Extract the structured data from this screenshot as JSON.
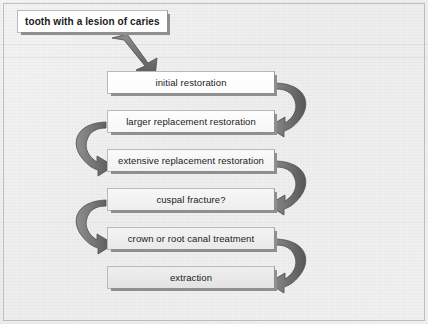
{
  "diagram": {
    "title_box": {
      "label": "tooth with a lesion of caries"
    },
    "steps": [
      {
        "id": "initial-restoration",
        "label": "initial restoration"
      },
      {
        "id": "larger-replacement-restoration",
        "label": "larger replacement restoration"
      },
      {
        "id": "extensive-replacement-restoration",
        "label": "extensive replacement restoration"
      },
      {
        "id": "cuspal-fracture",
        "label": "cuspal fracture?"
      },
      {
        "id": "crown-or-root-canal-treatment",
        "label": "crown or root canal treatment"
      },
      {
        "id": "extraction",
        "label": "extraction"
      }
    ],
    "connectors": [
      {
        "id": "entry-arrow",
        "kind": "straight-diagonal-arrow",
        "from": "tooth with a lesion of caries",
        "to": "initial restoration",
        "side": "center"
      },
      {
        "id": "loop-arrow-1",
        "kind": "curved-arrow",
        "from": "initial restoration",
        "to": "larger replacement restoration",
        "side": "right"
      },
      {
        "id": "loop-arrow-2",
        "kind": "curved-arrow",
        "from": "larger replacement restoration",
        "to": "extensive replacement restoration",
        "side": "left"
      },
      {
        "id": "loop-arrow-3",
        "kind": "curved-arrow",
        "from": "extensive replacement restoration",
        "to": "cuspal fracture?",
        "side": "right"
      },
      {
        "id": "loop-arrow-4",
        "kind": "curved-arrow",
        "from": "cuspal fracture?",
        "to": "crown or root canal treatment",
        "side": "left"
      },
      {
        "id": "loop-arrow-5",
        "kind": "curved-arrow",
        "from": "crown or root canal treatment",
        "to": "extraction",
        "side": "right"
      }
    ],
    "colors": {
      "background": "#efefef",
      "box_fill_light": "#ffffff",
      "box_fill_gray": "#e6e6e6",
      "box_border": "#b9b9b9",
      "shadow": "#8f8f8f",
      "arrow_fill": "#6e6e6e",
      "arrow_stroke": "#4a4a4a",
      "text": "#1a1a1a"
    }
  }
}
